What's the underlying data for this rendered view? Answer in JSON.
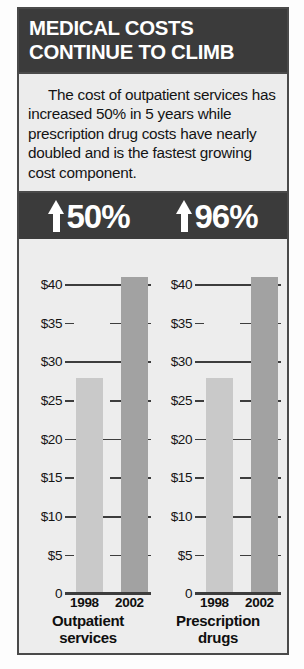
{
  "headline": {
    "line1": "MEDICAL COSTS",
    "line2": "CONTINUE TO CLIMB"
  },
  "deck": {
    "text": "The cost of outpatient services has increased 50% in 5 years while prescription drug costs have nearly doubled and is the fastest growing cost component."
  },
  "pct_band": {
    "items": [
      {
        "arrow": "up-arrow-icon",
        "value": "50%"
      },
      {
        "arrow": "up-arrow-icon",
        "value": "96%"
      }
    ]
  },
  "colors": {
    "band_dark": "#3b3b3b",
    "panel_bg": "#ededed",
    "bar_1998": "#c9c9c9",
    "bar_2002": "#a2a2a2",
    "rule": "#3d3d3d",
    "text": "#141414"
  },
  "chart_data": [
    {
      "type": "bar",
      "title": "Outpatient services",
      "title_line1": "Outpatient",
      "title_line2": "services",
      "categories": [
        "1998",
        "2002"
      ],
      "values": [
        28,
        41
      ],
      "value_labels": [
        "$28",
        "$41"
      ],
      "series": [
        {
          "name": "1998",
          "value": 28,
          "color": "#c9c9c9"
        },
        {
          "name": "2002",
          "value": 41,
          "color": "#a2a2a2"
        }
      ],
      "xlabel": "",
      "ylabel": "",
      "ylim": [
        0,
        45
      ],
      "yticks": [
        40,
        35,
        30,
        25,
        20,
        15,
        10,
        5,
        0
      ],
      "ytick_labels": [
        "$40",
        "$35",
        "$30",
        "$25",
        "$20",
        "$15",
        "$10",
        "$5",
        "0"
      ],
      "grid": true,
      "legend": "none",
      "change_pct": "50%",
      "change_direction": "up"
    },
    {
      "type": "bar",
      "title": "Prescription drugs",
      "title_line1": "Prescription",
      "title_line2": "drugs",
      "categories": [
        "1998",
        "2002"
      ],
      "values": [
        28,
        41
      ],
      "value_labels": [
        "$28",
        "$41"
      ],
      "series": [
        {
          "name": "1998",
          "value": 28,
          "color": "#c9c9c9"
        },
        {
          "name": "2002",
          "value": 41,
          "color": "#a2a2a2"
        }
      ],
      "xlabel": "",
      "ylabel": "",
      "ylim": [
        0,
        45
      ],
      "yticks": [
        40,
        35,
        30,
        25,
        20,
        15,
        10,
        5,
        0
      ],
      "ytick_labels": [
        "$40",
        "$35",
        "$30",
        "$25",
        "$20",
        "$15",
        "$10",
        "$5",
        "0"
      ],
      "grid": true,
      "legend": "none",
      "change_pct": "96%",
      "change_direction": "up"
    }
  ]
}
